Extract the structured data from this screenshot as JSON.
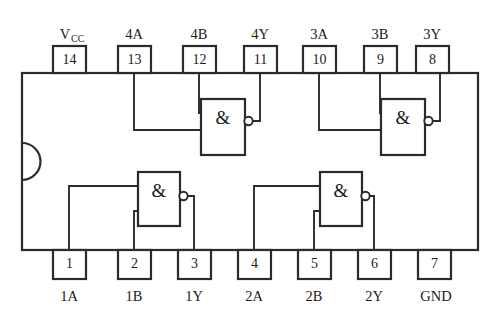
{
  "diagram": {
    "colors": {
      "line": "#2b2b2b",
      "background": "#ffffff",
      "text": "#1a1a1a"
    },
    "gate_symbol": "&",
    "vcc_main": "V",
    "vcc_sub": "CC",
    "top_pins": [
      {
        "number": "14",
        "label": "VCC",
        "x": 69
      },
      {
        "number": "13",
        "label": "4A",
        "x": 134
      },
      {
        "number": "12",
        "label": "4B",
        "x": 199
      },
      {
        "number": "11",
        "label": "4Y",
        "x": 260
      },
      {
        "number": "10",
        "label": "3A",
        "x": 319
      },
      {
        "number": "9",
        "label": "3B",
        "x": 380
      },
      {
        "number": "8",
        "label": "3Y",
        "x": 432
      }
    ],
    "bottom_pins": [
      {
        "number": "1",
        "label": "1A",
        "x": 69
      },
      {
        "number": "2",
        "label": "1B",
        "x": 134
      },
      {
        "number": "3",
        "label": "1Y",
        "x": 194
      },
      {
        "number": "4",
        "label": "2A",
        "x": 254
      },
      {
        "number": "5",
        "label": "2B",
        "x": 314
      },
      {
        "number": "6",
        "label": "2Y",
        "x": 374
      },
      {
        "number": "7",
        "label": "GND",
        "x": 434
      }
    ],
    "gates": [
      {
        "name": "gate-1",
        "symbol": "&",
        "inputs": [
          "1A",
          "1B"
        ],
        "output": "1Y"
      },
      {
        "name": "gate-2",
        "symbol": "&",
        "inputs": [
          "2A",
          "2B"
        ],
        "output": "2Y"
      },
      {
        "name": "gate-3",
        "symbol": "&",
        "inputs": [
          "3A",
          "3B"
        ],
        "output": "3Y"
      },
      {
        "name": "gate-4",
        "symbol": "&",
        "inputs": [
          "4A",
          "4B"
        ],
        "output": "4Y"
      }
    ]
  }
}
